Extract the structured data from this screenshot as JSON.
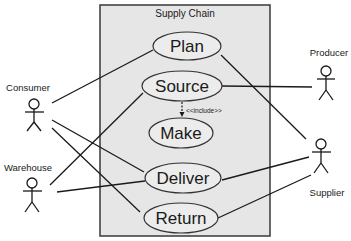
{
  "diagram": {
    "type": "use-case",
    "system": {
      "title": "Supply Chain"
    },
    "use_cases": [
      {
        "id": "plan",
        "label": "Plan"
      },
      {
        "id": "source",
        "label": "Source"
      },
      {
        "id": "make",
        "label": "Make"
      },
      {
        "id": "deliver",
        "label": "Deliver"
      },
      {
        "id": "return",
        "label": "Return"
      }
    ],
    "actors": [
      {
        "id": "consumer",
        "label": "Consumer"
      },
      {
        "id": "warehouse",
        "label": "Warehouse"
      },
      {
        "id": "producer",
        "label": "Producer"
      },
      {
        "id": "supplier",
        "label": "Supplier"
      }
    ],
    "associations": [
      {
        "from": "consumer",
        "to": "plan"
      },
      {
        "from": "consumer",
        "to": "deliver"
      },
      {
        "from": "consumer",
        "to": "return"
      },
      {
        "from": "warehouse",
        "to": "source"
      },
      {
        "from": "warehouse",
        "to": "deliver"
      },
      {
        "from": "producer",
        "to": "source"
      },
      {
        "from": "supplier",
        "to": "plan"
      },
      {
        "from": "supplier",
        "to": "deliver"
      },
      {
        "from": "supplier",
        "to": "return"
      }
    ],
    "include": {
      "from": "source",
      "to": "make",
      "label": "<<include>>"
    },
    "colors": {
      "boundary_fill": "#e6e6e6",
      "boundary_stroke": "#444444",
      "ellipse_fill": "#ececec",
      "ellipse_stroke": "#333333",
      "line": "#1a1a1a"
    }
  }
}
